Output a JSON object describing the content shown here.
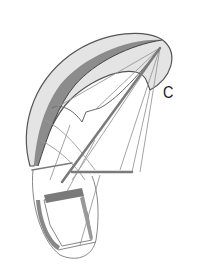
{
  "figure": {
    "label": "C",
    "colors": {
      "background": "#ffffff",
      "canopy_fill": "#e4e4e4",
      "canopy_band": "#8c8c8c",
      "outline": "#555555",
      "lines": "#9a9a9a",
      "harness_frame": "#7a7a7a"
    }
  }
}
